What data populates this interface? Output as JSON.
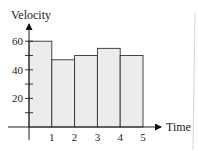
{
  "chart_data": {
    "type": "bar",
    "title": "",
    "xlabel": "Time",
    "ylabel": "Velocity",
    "x_ticks": [
      "1",
      "2",
      "3",
      "4",
      "5"
    ],
    "y_ticks": [
      "20",
      "40",
      "60"
    ],
    "categories": [
      "0-1",
      "1-2",
      "2-3",
      "3-4",
      "4-5"
    ],
    "values": [
      60,
      47,
      50,
      55,
      50
    ],
    "ylim": [
      0,
      70
    ],
    "xlim": [
      0,
      6
    ],
    "grid": false,
    "legend": null,
    "bar_color": "#ececec",
    "edge_color": "#333333"
  }
}
